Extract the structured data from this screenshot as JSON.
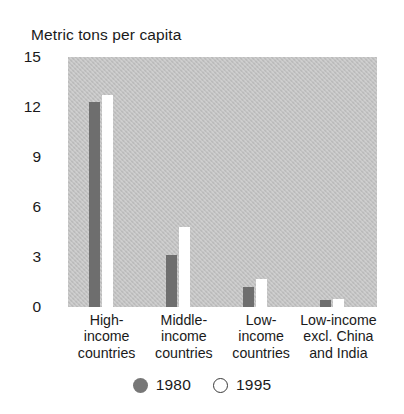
{
  "chart_data": {
    "type": "bar",
    "title": "Metric tons per capita",
    "xlabel": "",
    "ylabel": "Metric tons per capita",
    "ylim": [
      0,
      15
    ],
    "yticks": [
      0,
      3,
      6,
      9,
      12,
      15
    ],
    "grid": false,
    "legend_position": "bottom",
    "categories": [
      "High-income countries",
      "Middle-income countries",
      "Low-income countries",
      "Low-income excl. China and India"
    ],
    "category_lines": [
      [
        "High-",
        "income",
        "countries"
      ],
      [
        "Middle-",
        "income",
        "countries"
      ],
      [
        "Low-",
        "income",
        "countries"
      ],
      [
        "Low-income",
        "excl. China",
        "and India"
      ]
    ],
    "series": [
      {
        "name": "1980",
        "color": "#6e6e6e",
        "marker": "filled-circle",
        "values": [
          12.3,
          3.1,
          1.2,
          0.4
        ]
      },
      {
        "name": "1995",
        "color": "#ffffff",
        "marker": "open-circle",
        "values": [
          12.7,
          4.8,
          1.7,
          0.5
        ]
      }
    ]
  },
  "axis": {
    "title": "Metric tons per capita",
    "ytick_labels": [
      "15",
      "12",
      "9",
      "6",
      "3",
      "0"
    ]
  },
  "legend": {
    "items": [
      {
        "label": "1980",
        "marker": "filled-circle"
      },
      {
        "label": "1995",
        "marker": "open-circle"
      }
    ]
  },
  "colors": {
    "plot_background": "#c2c2c2",
    "series_1980": "#6e6e6e",
    "series_1995": "#ffffff",
    "text": "#1a1a1a",
    "page_background": "#ffffff"
  }
}
